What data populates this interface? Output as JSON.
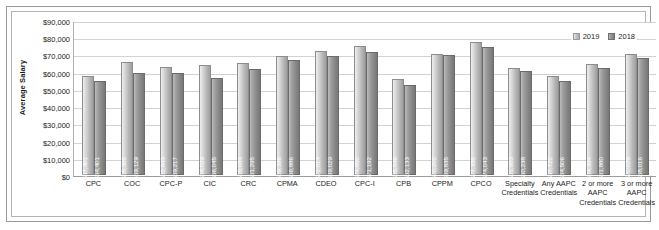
{
  "chart_data": {
    "type": "bar",
    "title": "",
    "xlabel": "",
    "ylabel": "Average Salary",
    "ylim": [
      0,
      90000
    ],
    "grid": true,
    "legend_position": "top-right",
    "ytick_labels": [
      "$90,000",
      "$80,000",
      "$70,000",
      "$60,000",
      "$50,000",
      "$40,000",
      "$30,000",
      "$20,000",
      "$10,000",
      "$0"
    ],
    "ytick_values": [
      90000,
      80000,
      70000,
      60000,
      50000,
      40000,
      30000,
      20000,
      10000,
      0
    ],
    "categories": [
      "CPC",
      "COC",
      "CPC-P",
      "CIC",
      "CRC",
      "CPMA",
      "CDEO",
      "CPC-I",
      "CPB",
      "CPPM",
      "CPCO",
      "Specialty Credentials",
      "Any AAPC Credentials",
      "2 or more AAPC Credentials",
      "3 or more AAPC Credentials"
    ],
    "series": [
      {
        "name": "2019",
        "color": "#c3c3c3",
        "values": [
          57301,
          65355,
          62843,
          64029,
          65084,
          69396,
          72014,
          74850,
          55546,
          70202,
          77335,
          61953,
          57722,
          64394,
          70029
        ],
        "labels": [
          "$57,301",
          "$65,355",
          "$62,843",
          "$64,029",
          "$65,084",
          "$69,396",
          "$72,014",
          "$74,850",
          "$55,546",
          "$70,202",
          "$77,335",
          "$61,953",
          "$57,722",
          "$64,394",
          "$70,029"
        ]
      },
      {
        "name": "2018",
        "color": "#939393",
        "values": [
          54401,
          59129,
          59217,
          56045,
          61295,
          66886,
          69029,
          71192,
          52133,
          69835,
          74043,
          60238,
          54506,
          61880,
          68016
        ],
        "labels": [
          "$54,401",
          "$59,129",
          "$59,217",
          "$56,045",
          "$61,295",
          "$66,886",
          "$69,029",
          "$71,192",
          "$52,133",
          "$69,835",
          "$74,043",
          "$60,238",
          "$54,506",
          "$61,880",
          "$68,016"
        ]
      }
    ]
  }
}
